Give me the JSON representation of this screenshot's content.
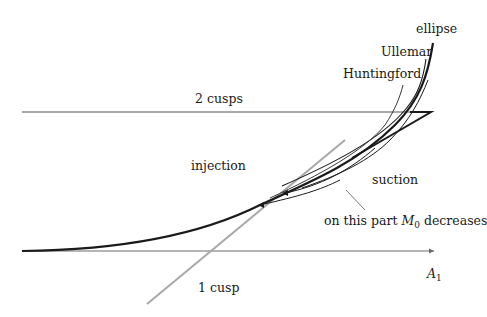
{
  "diagram": {
    "labels": {
      "ellipse": "ellipse",
      "ullemar": "Ullemar",
      "huntingford": "Huntingford",
      "two_cusps": "2 cusps",
      "injection": "injection",
      "suction": "suction",
      "m0_prefix": "on this part ",
      "m0_var": "M",
      "m0_sub": "0",
      "m0_suffix": " decreases",
      "one_cusp": "1 cusp",
      "axis_var": "A",
      "axis_sub": "1"
    },
    "colors": {
      "background": "#ffffff",
      "curve": "#1a1a1a",
      "gray_line": "#a8a8a8",
      "axis": "#555555"
    }
  }
}
